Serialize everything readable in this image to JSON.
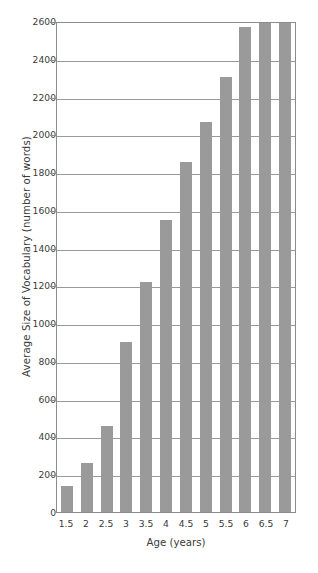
{
  "chart_data": {
    "type": "bar",
    "title": "",
    "xlabel": "Age (years)",
    "ylabel": "Average Size of Vocabulary (number of words)",
    "categories": [
      "1.5",
      "2",
      "2.5",
      "3",
      "3.5",
      "4",
      "4.5",
      "5",
      "5.5",
      "6",
      "6.5",
      "7"
    ],
    "values": [
      140,
      260,
      455,
      900,
      1220,
      1545,
      1855,
      2065,
      2305,
      2570,
      2610,
      2610
    ],
    "series": [
      {
        "name": "Average Size of Vocabulary",
        "values": [
          140,
          260,
          455,
          900,
          1220,
          1545,
          1855,
          2065,
          2305,
          2570,
          2610,
          2610
        ]
      }
    ],
    "ylim": [
      0,
      2600
    ],
    "xlim_categories": 12,
    "ytick_labels": [
      "0",
      "200",
      "400",
      "600",
      "800",
      "1000",
      "1200",
      "1400",
      "1600",
      "1800",
      "2000",
      "2200",
      "2400",
      "2600"
    ],
    "ytick_values": [
      0,
      200,
      400,
      600,
      800,
      1000,
      1200,
      1400,
      1600,
      1800,
      2000,
      2200,
      2400,
      2600
    ],
    "grid": true,
    "grid_axis": "y",
    "legend": false,
    "legend_position": "none",
    "bar_color": "#9a9a9a",
    "grid_color": "#9a9a9a",
    "axis_color": "#8c8c8c",
    "text_color": "#3a3a3a",
    "background_color": "#ffffff"
  }
}
